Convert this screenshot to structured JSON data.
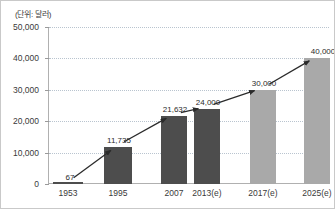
{
  "chart_data": {
    "type": "bar",
    "title": "",
    "subtitle": "",
    "unit_label": "(단위: 달러)",
    "xlabel": "",
    "ylabel": "",
    "categories": [
      "1953",
      "1995",
      "2007",
      "2013(e)",
      "2017(e)",
      "2025(e)"
    ],
    "values": [
      67,
      11735,
      21632,
      24000,
      30000,
      40000
    ],
    "value_labels": [
      "67",
      "11,735",
      "21,632",
      "24,000",
      "30,000",
      "40,000"
    ],
    "series": [
      {
        "name": "1인당 국민소득",
        "values": [
          67,
          11735,
          21632,
          24000,
          30000,
          40000
        ]
      }
    ],
    "ylim": [
      0,
      50000
    ],
    "ytick_values": [
      0,
      10000,
      20000,
      30000,
      40000,
      50000
    ],
    "ytick_labels": [
      "0",
      "10,000",
      "20,000",
      "30,000",
      "40,000",
      "50,000"
    ],
    "grid": true,
    "legend": "none",
    "annotations": [
      {
        "type": "trend-arrow",
        "description": "rising arrow connecting bar tops"
      }
    ],
    "bar_colors": {
      "actual": "#4d4d4d",
      "estimate": "#a9a9a9"
    },
    "bar_kind": [
      "actual",
      "actual",
      "actual",
      "actual",
      "estimate",
      "estimate"
    ],
    "grid_color": "#b9c4cf",
    "axis_color": "#b0b0b0",
    "text_color": "#3a3a3a"
  }
}
